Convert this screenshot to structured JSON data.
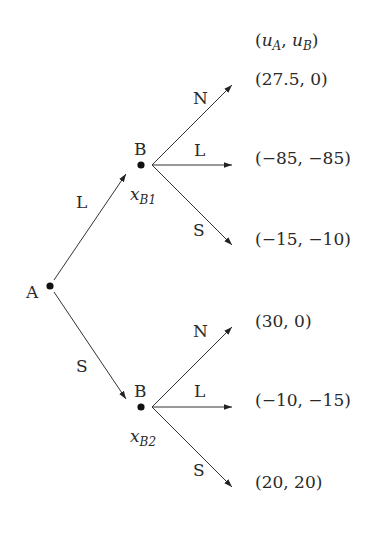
{
  "diagram": {
    "type": "extensive-form game tree",
    "payoff_header": {
      "open": "(",
      "u_a": "u",
      "u_a_sub": "A",
      "comma": ", ",
      "u_b": "u",
      "u_b_sub": "B",
      "close": ")"
    },
    "nodes": {
      "root": {
        "player": "A"
      },
      "b1": {
        "player": "B",
        "info_label": "x",
        "info_sub": "B1"
      },
      "b2": {
        "player": "B",
        "info_label": "x",
        "info_sub": "B2"
      }
    },
    "root_actions": [
      {
        "label": "L",
        "to": "b1"
      },
      {
        "label": "S",
        "to": "b2"
      }
    ],
    "b1_actions": [
      {
        "label": "N",
        "payoff": "(27.5, 0)"
      },
      {
        "label": "L",
        "payoff": "(−85, −85)"
      },
      {
        "label": "S",
        "payoff": "(−15, −10)"
      }
    ],
    "b2_actions": [
      {
        "label": "N",
        "payoff": "(30, 0)"
      },
      {
        "label": "L",
        "payoff": "(−10, −15)"
      },
      {
        "label": "S",
        "payoff": "(20, 20)"
      }
    ],
    "colors": {
      "line": "#333333",
      "text": "#2a2a2a",
      "node": "#111111",
      "background": "#ffffff"
    }
  }
}
